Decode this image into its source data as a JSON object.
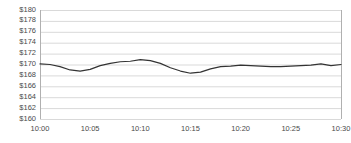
{
  "chart_data": {
    "type": "line",
    "title": "",
    "xlabel": "",
    "ylabel": "",
    "ylim": [
      160,
      180
    ],
    "y_tick_labels": [
      "$180",
      "$178",
      "$176",
      "$174",
      "$172",
      "$170",
      "$168",
      "$166",
      "$164",
      "$162",
      "$160"
    ],
    "y_tick_values": [
      180,
      178,
      176,
      174,
      172,
      170,
      168,
      166,
      164,
      162,
      160
    ],
    "x_tick_labels": [
      "10:00",
      "10:05",
      "10:10",
      "10:15",
      "10:20",
      "10:25",
      "10:30"
    ],
    "x_tick_values": [
      0,
      5,
      10,
      15,
      20,
      25,
      30
    ],
    "xlim": [
      0,
      30
    ],
    "grid": true,
    "legend": false,
    "series": [
      {
        "name": "price",
        "x": [
          0,
          1,
          2,
          3,
          4,
          5,
          6,
          7,
          8,
          9,
          10,
          11,
          12,
          13,
          14,
          15,
          16,
          17,
          18,
          19,
          20,
          21,
          22,
          23,
          24,
          25,
          26,
          27,
          28,
          29,
          30
        ],
        "values": [
          170.1,
          170.0,
          169.6,
          169.0,
          168.8,
          169.1,
          169.8,
          170.2,
          170.5,
          170.6,
          170.9,
          170.7,
          170.2,
          169.4,
          168.8,
          168.4,
          168.6,
          169.2,
          169.6,
          169.7,
          169.9,
          169.8,
          169.7,
          169.6,
          169.6,
          169.7,
          169.8,
          169.9,
          170.1,
          169.8,
          170.0
        ]
      }
    ],
    "style": {
      "line_color": "#333333",
      "line_width": 1.2,
      "grid_color": "#d9d9d9",
      "axis_color": "#b0b0b0",
      "background": "#ffffff",
      "tick_label_color": "#4a4a4a"
    },
    "plot_area": {
      "left": 40,
      "right": 341,
      "top": 10,
      "bottom": 119
    }
  }
}
